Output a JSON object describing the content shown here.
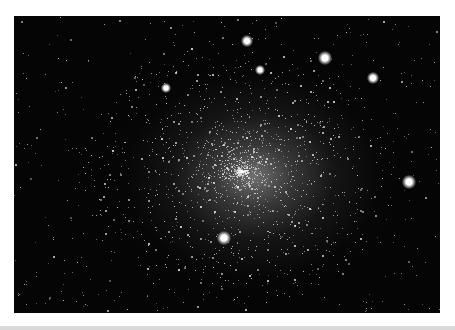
{
  "image": {
    "subject": "Globular star cluster",
    "description": "Dense globular star cluster against a black sky, with a bright, crowded core and scattered foreground stars",
    "colors": {
      "background": "#050505",
      "border": "#ffffff",
      "stars": "#ffffff",
      "bottom_strip": "#d9d9d9"
    },
    "bright_stars": [
      {
        "x": 325,
        "y": 58,
        "r": 5
      },
      {
        "x": 373,
        "y": 78,
        "r": 4
      },
      {
        "x": 409,
        "y": 182,
        "r": 5
      },
      {
        "x": 247,
        "y": 41,
        "r": 4
      },
      {
        "x": 224,
        "y": 238,
        "r": 5
      },
      {
        "x": 166,
        "y": 88,
        "r": 3
      },
      {
        "x": 260,
        "y": 70,
        "r": 3
      }
    ]
  }
}
